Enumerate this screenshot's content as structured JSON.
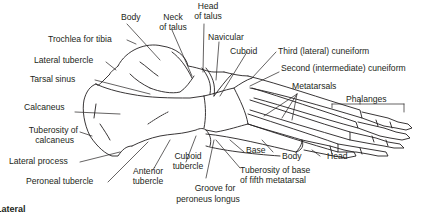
{
  "diagram": {
    "caption": "Lateral",
    "line_color": "#231f20",
    "background": "#ffffff",
    "labels": {
      "body_talus": "Body",
      "neck_talus_1": "Neck",
      "neck_talus_2": "of talus",
      "head_talus_1": "Head",
      "head_talus_2": "of talus",
      "trochlea": "Trochlea for tibia",
      "navicular": "Navicular",
      "lateral_tubercle": "Lateral tubercle",
      "cuboid": "Cuboid",
      "third_cuneiform": "Third (lateral) cuneiform",
      "tarsal_sinus": "Tarsal sinus",
      "second_cuneiform": "Second (intermediate) cuneiform",
      "metatarsals": "Metatarsals",
      "phalanges": "Phalanges",
      "calcaneus": "Calcaneus",
      "tuberosity_calcaneus_1": "Tuberosity of",
      "tuberosity_calcaneus_2": "calcaneus",
      "lateral_process": "Lateral process",
      "peroneal_tubercle": "Peroneal tubercle",
      "anterior_tubercle_1": "Anterior",
      "anterior_tubercle_2": "tubercle",
      "cuboid_tubercle_1": "Cuboid",
      "cuboid_tubercle_2": "tubercle",
      "groove_1": "Groove for",
      "groove_2": "peroneus longus",
      "base": "Base",
      "body_metatarsal": "Body",
      "head_metatarsal": "Head",
      "tuberosity_fifth_1": "Tuberosity of base",
      "tuberosity_fifth_2": "of fifth metatarsal"
    }
  }
}
